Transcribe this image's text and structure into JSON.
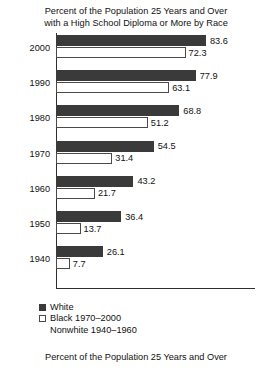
{
  "chart_data": {
    "type": "bar",
    "orientation": "horizontal",
    "title": "Percent of the Population 25 Years and Over with a High School Diploma or More by Race",
    "title_lines": [
      "Percent of the Population 25 Years and Over",
      "with a High School Diploma or More by Race"
    ],
    "footer": "Percent of the Population 25 Years and Over",
    "categories": [
      "2000",
      "1990",
      "1980",
      "1970",
      "1960",
      "1950",
      "1940"
    ],
    "series": [
      {
        "name": "White",
        "color": "#3a3a3a",
        "values": [
          83.6,
          77.9,
          68.8,
          54.5,
          43.2,
          36.4,
          26.1
        ]
      },
      {
        "name": "Black 1970–2000 / Nonwhite 1940–1960",
        "color": "#ffffff",
        "values": [
          72.3,
          63.1,
          51.2,
          31.4,
          21.7,
          13.7,
          7.7
        ]
      }
    ],
    "xlabel": "",
    "ylabel": "",
    "xlim": [
      0,
      111
    ],
    "grid": false,
    "legend_position": "bottom-left",
    "legend": [
      {
        "label": "White",
        "swatch": "filled"
      },
      {
        "label": "Black 1970–2000",
        "swatch": "hollow"
      },
      {
        "label": "Nonwhite 1940–1960",
        "swatch": "none"
      }
    ]
  },
  "groups": [
    {
      "year": "2000",
      "white": "83.6",
      "black": "72.3"
    },
    {
      "year": "1990",
      "white": "77.9",
      "black": "63.1"
    },
    {
      "year": "1980",
      "white": "68.8",
      "black": "51.2"
    },
    {
      "year": "1970",
      "white": "54.5",
      "black": "31.4"
    },
    {
      "year": "1960",
      "white": "43.2",
      "black": "21.7"
    },
    {
      "year": "1950",
      "white": "36.4",
      "black": "13.7"
    },
    {
      "year": "1940",
      "white": "26.1",
      "black": "7.7"
    }
  ]
}
